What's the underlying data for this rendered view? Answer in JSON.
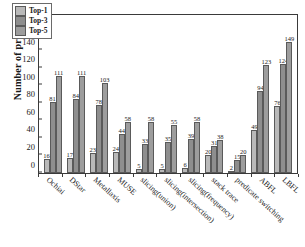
{
  "chart_data": {
    "type": "bar",
    "title": "",
    "xlabel": "",
    "ylabel": "Number of project",
    "ylim": [
      0,
      180
    ],
    "yticks": [
      0,
      20,
      40,
      60,
      80,
      100,
      120,
      140,
      160,
      180
    ],
    "grid": false,
    "legend_position": "top-left",
    "categories": [
      "Ochiai",
      "DStar",
      "Metallaxis",
      "MUSE",
      "slicing(union)",
      "slicing(intersection)",
      "slicing(frequency)",
      "stack trace",
      "predicate switching",
      "ABFL",
      "LBFL"
    ],
    "series": [
      {
        "name": "Top-1",
        "color": "#b9b9b9",
        "values": [
          16,
          17,
          23,
          24,
          5,
          5,
          6,
          20,
          2,
          49,
          76
        ]
      },
      {
        "name": "Top-3",
        "color": "#8e8e8e",
        "values": [
          81,
          84,
          78,
          44,
          33,
          35,
          39,
          31,
          15,
          94,
          124
        ]
      },
      {
        "name": "Top-5",
        "color": "#9d9d9d",
        "values": [
          111,
          111,
          103,
          58,
          58,
          55,
          58,
          38,
          20,
          123,
          149
        ]
      }
    ]
  }
}
